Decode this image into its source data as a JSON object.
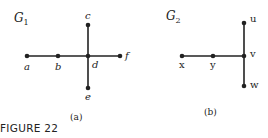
{
  "figure_label": "FIGURE 22",
  "graphs": [
    {
      "name": "G",
      "subscript": "1",
      "caption": "(a)",
      "vertices": [
        "a",
        "b",
        "c",
        "d",
        "e",
        "f"
      ],
      "edges": [
        [
          "a",
          "b"
        ],
        [
          "b",
          "d"
        ],
        [
          "d",
          "f"
        ],
        [
          "c",
          "d"
        ],
        [
          "d",
          "e"
        ]
      ]
    },
    {
      "name": "G",
      "subscript": "2",
      "caption": "(b)",
      "vertices": [
        "x",
        "y",
        "u",
        "v",
        "w"
      ],
      "edges": [
        [
          "x",
          "y"
        ],
        [
          "y",
          "v"
        ],
        [
          "u",
          "v"
        ],
        [
          "v",
          "w"
        ]
      ]
    }
  ]
}
